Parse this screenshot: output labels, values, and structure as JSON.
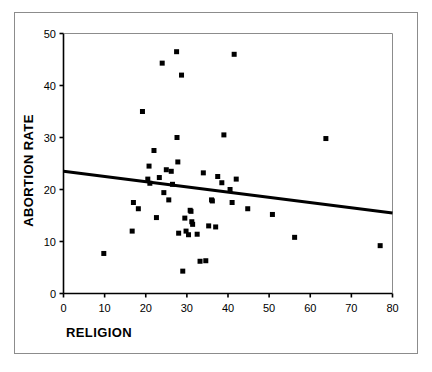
{
  "chart_data": {
    "type": "scatter",
    "title": "",
    "xlabel": "RELIGION",
    "ylabel": "ABORTION RATE",
    "xlim": [
      0,
      80
    ],
    "ylim": [
      0,
      50
    ],
    "xticks": [
      0,
      10,
      20,
      30,
      40,
      50,
      60,
      70,
      80
    ],
    "yticks": [
      0,
      10,
      20,
      30,
      40,
      50
    ],
    "xtick_labels": [
      "0",
      "10",
      "20",
      "30",
      "40",
      "50",
      "60",
      "70",
      "80"
    ],
    "ytick_labels": [
      "0",
      "10",
      "20",
      "30",
      "40",
      "50"
    ],
    "grid": false,
    "legend": null,
    "marker": "square",
    "marker_color": "#000000",
    "marker_size": 5,
    "points": [
      {
        "x": 9.8,
        "y": 7.7
      },
      {
        "x": 16.7,
        "y": 12.0
      },
      {
        "x": 17.0,
        "y": 17.5
      },
      {
        "x": 18.2,
        "y": 16.3
      },
      {
        "x": 19.2,
        "y": 35.0
      },
      {
        "x": 20.5,
        "y": 22.0
      },
      {
        "x": 20.8,
        "y": 24.5
      },
      {
        "x": 21.0,
        "y": 21.2
      },
      {
        "x": 22.0,
        "y": 27.5
      },
      {
        "x": 22.6,
        "y": 14.6
      },
      {
        "x": 23.3,
        "y": 22.3
      },
      {
        "x": 24.0,
        "y": 44.3
      },
      {
        "x": 24.4,
        "y": 19.4
      },
      {
        "x": 25.0,
        "y": 23.8
      },
      {
        "x": 25.6,
        "y": 18.0
      },
      {
        "x": 26.2,
        "y": 23.5
      },
      {
        "x": 26.5,
        "y": 21.0
      },
      {
        "x": 27.5,
        "y": 46.5
      },
      {
        "x": 27.6,
        "y": 30.0
      },
      {
        "x": 27.8,
        "y": 25.3
      },
      {
        "x": 28.0,
        "y": 11.6
      },
      {
        "x": 28.7,
        "y": 42.0
      },
      {
        "x": 29.0,
        "y": 4.3
      },
      {
        "x": 29.5,
        "y": 14.5
      },
      {
        "x": 29.8,
        "y": 12.0
      },
      {
        "x": 30.4,
        "y": 11.3
      },
      {
        "x": 30.8,
        "y": 16.0
      },
      {
        "x": 31.0,
        "y": 15.8
      },
      {
        "x": 31.2,
        "y": 13.8
      },
      {
        "x": 31.4,
        "y": 13.3
      },
      {
        "x": 32.5,
        "y": 11.4
      },
      {
        "x": 33.2,
        "y": 6.2
      },
      {
        "x": 34.0,
        "y": 23.2
      },
      {
        "x": 34.6,
        "y": 6.3
      },
      {
        "x": 35.3,
        "y": 13.0
      },
      {
        "x": 36.0,
        "y": 18.0
      },
      {
        "x": 36.2,
        "y": 17.8
      },
      {
        "x": 37.0,
        "y": 12.8
      },
      {
        "x": 37.5,
        "y": 22.5
      },
      {
        "x": 38.5,
        "y": 21.3
      },
      {
        "x": 39.0,
        "y": 30.5
      },
      {
        "x": 40.5,
        "y": 20.0
      },
      {
        "x": 41.0,
        "y": 17.5
      },
      {
        "x": 41.5,
        "y": 46.0
      },
      {
        "x": 42.0,
        "y": 22.0
      },
      {
        "x": 44.8,
        "y": 16.3
      },
      {
        "x": 50.8,
        "y": 15.2
      },
      {
        "x": 56.2,
        "y": 10.8
      },
      {
        "x": 63.8,
        "y": 29.8
      },
      {
        "x": 77.0,
        "y": 9.2
      }
    ],
    "trendline": {
      "name": "regression-line",
      "x_start": 0,
      "y_start": 23.5,
      "x_end": 80,
      "y_end": 15.5,
      "color": "#000000",
      "width": 3
    }
  }
}
